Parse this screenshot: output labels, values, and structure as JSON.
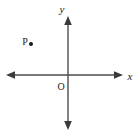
{
  "figure": {
    "type": "coordinate-plane-diagram",
    "background_color": "#ffffff",
    "stroke_color": "#4d4d4d",
    "text_color": "#1a1a1a",
    "width": 137,
    "height": 135
  },
  "axes": {
    "origin": {
      "x": 68,
      "y": 75,
      "label": "O",
      "label_x": 59,
      "label_y": 89
    },
    "x_axis": {
      "label": "x",
      "label_x": 127,
      "label_y": 80,
      "start_x": 7,
      "end_x": 122,
      "y": 75,
      "arrow_start": true,
      "arrow_end": true
    },
    "y_axis": {
      "label": "y",
      "label_x": 62,
      "label_y": 13,
      "start_y": 17,
      "end_y": 128,
      "x": 68,
      "arrow_start": true,
      "arrow_end": true
    }
  },
  "points": [
    {
      "label": "P",
      "label_x": 22,
      "label_y": 45,
      "dot_x": 31,
      "dot_y": 44,
      "dot_radius": 2,
      "quadrant": "II"
    }
  ]
}
